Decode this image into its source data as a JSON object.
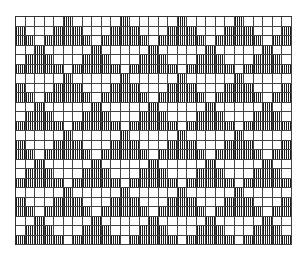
{
  "diagram": {
    "type": "weaving-draft-grid",
    "columns": 29,
    "rows": 24,
    "fill_style": "vertical-hatch",
    "colors": {
      "ink": "#1a1a1a",
      "grid_line": "#444444",
      "background": "#ffffff"
    },
    "motif": {
      "description": "Repeating triangles (1, 3, 5 cells wide) in 3-row bands; bands alternate horizontal offset by 3 columns",
      "period_columns": 6,
      "band_rows": 3,
      "band_A_centers": [
        -1,
        5,
        11,
        17,
        23,
        29
      ],
      "band_B_centers": [
        2,
        8,
        14,
        20,
        26
      ]
    },
    "bands": [
      "A",
      "B",
      "A",
      "B",
      "A",
      "B",
      "A",
      "B"
    ]
  }
}
